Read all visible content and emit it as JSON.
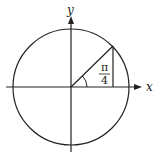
{
  "diagram": {
    "type": "unit-circle",
    "x_axis_label": "x",
    "y_axis_label": "y",
    "angle": {
      "numerator": "π",
      "denominator": "4"
    },
    "colors": {
      "stroke": "#222222",
      "background": "#ffffff"
    }
  }
}
